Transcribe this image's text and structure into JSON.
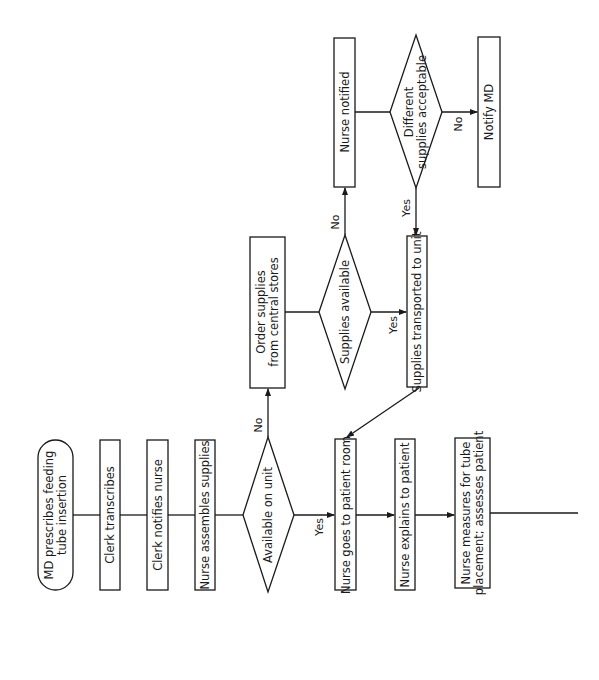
{
  "diagram": {
    "type": "flowchart",
    "orientation": "rotated-90-ccw",
    "colors": {
      "stroke": "#1a1a1a",
      "fill": "#ffffff",
      "background": "#ffffff"
    },
    "nodes": [
      {
        "id": "start",
        "shape": "terminator",
        "lines": [
          "MD prescribes feeding",
          "tube insertion"
        ]
      },
      {
        "id": "clerk_transcribes",
        "shape": "process",
        "lines": [
          "Clerk transcribes"
        ]
      },
      {
        "id": "clerk_notifies",
        "shape": "process",
        "lines": [
          "Clerk notifies nurse"
        ]
      },
      {
        "id": "nurse_assembles",
        "shape": "process",
        "lines": [
          "Nurse assembles supplies"
        ]
      },
      {
        "id": "available_on_unit",
        "shape": "decision",
        "lines": [
          "Available on unit"
        ]
      },
      {
        "id": "order_supplies",
        "shape": "process",
        "lines": [
          "Order supplies",
          "from central stores"
        ]
      },
      {
        "id": "supplies_available",
        "shape": "decision",
        "lines": [
          "Supplies available"
        ]
      },
      {
        "id": "nurse_notified",
        "shape": "process",
        "lines": [
          "Nurse notified"
        ]
      },
      {
        "id": "different_acceptable",
        "shape": "decision",
        "lines": [
          "Different",
          "supplies acceptable"
        ]
      },
      {
        "id": "notify_md",
        "shape": "process",
        "lines": [
          "Notify MD"
        ]
      },
      {
        "id": "supplies_transported",
        "shape": "process",
        "lines": [
          "Supplies transported to unit"
        ]
      },
      {
        "id": "nurse_goes",
        "shape": "process",
        "lines": [
          "Nurse goes to patient room"
        ]
      },
      {
        "id": "nurse_explains",
        "shape": "process",
        "lines": [
          "Nurse explains to patient"
        ]
      },
      {
        "id": "nurse_measures",
        "shape": "process",
        "lines": [
          "Nurse measures for tube",
          "placement; assesses patient"
        ]
      }
    ],
    "edges": [
      {
        "from": "start",
        "to": "clerk_transcribes",
        "label": ""
      },
      {
        "from": "clerk_transcribes",
        "to": "clerk_notifies",
        "label": ""
      },
      {
        "from": "clerk_notifies",
        "to": "nurse_assembles",
        "label": ""
      },
      {
        "from": "nurse_assembles",
        "to": "available_on_unit",
        "label": ""
      },
      {
        "from": "available_on_unit",
        "to": "order_supplies",
        "label": "No"
      },
      {
        "from": "available_on_unit",
        "to": "nurse_goes",
        "label": "Yes"
      },
      {
        "from": "order_supplies",
        "to": "supplies_available",
        "label": ""
      },
      {
        "from": "supplies_available",
        "to": "nurse_notified",
        "label": "No"
      },
      {
        "from": "supplies_available",
        "to": "supplies_transported",
        "label": "Yes"
      },
      {
        "from": "nurse_notified",
        "to": "different_acceptable",
        "label": ""
      },
      {
        "from": "different_acceptable",
        "to": "notify_md",
        "label": "No"
      },
      {
        "from": "different_acceptable",
        "to": "supplies_transported",
        "label": "Yes"
      },
      {
        "from": "supplies_transported",
        "to": "nurse_goes",
        "label": ""
      },
      {
        "from": "nurse_goes",
        "to": "nurse_explains",
        "label": ""
      },
      {
        "from": "nurse_explains",
        "to": "nurse_measures",
        "label": ""
      },
      {
        "from": "nurse_measures",
        "to": "continues",
        "label": ""
      }
    ]
  },
  "labels": {
    "start_1": "MD prescribes feeding",
    "start_2": "tube insertion",
    "clerk_transcribes": "Clerk transcribes",
    "clerk_notifies": "Clerk notifies nurse",
    "nurse_assembles": "Nurse assembles supplies",
    "available_on_unit": "Available on unit",
    "order_supplies_1": "Order supplies",
    "order_supplies_2": "from central stores",
    "supplies_available": "Supplies available",
    "nurse_notified": "Nurse notified",
    "different_acceptable_1": "Different",
    "different_acceptable_2": "supplies acceptable",
    "notify_md": "Notify MD",
    "supplies_transported": "Supplies transported to unit",
    "nurse_goes": "Nurse goes to patient room",
    "nurse_explains": "Nurse explains to patient",
    "nurse_measures_1": "Nurse measures for tube",
    "nurse_measures_2": "placement; assesses patient",
    "edge_no": "No",
    "edge_yes": "Yes"
  }
}
